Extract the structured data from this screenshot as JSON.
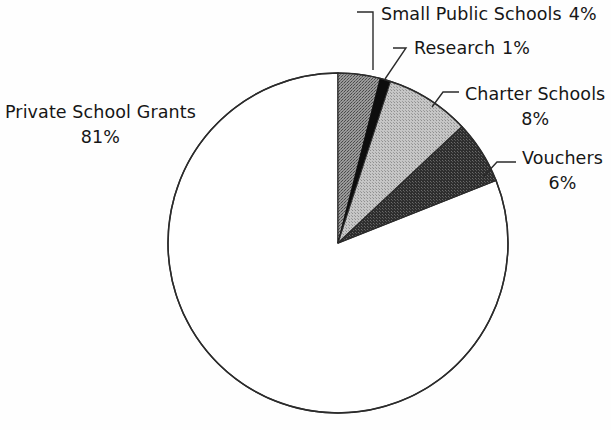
{
  "chart_data": {
    "type": "pie",
    "title": "",
    "subtitle": "",
    "xlabel": "",
    "ylabel": "",
    "legend_position": "callout-labels",
    "grid": false,
    "units": "percent",
    "start_angle_deg": 0,
    "direction": "clockwise",
    "categories": [
      "Small Public Schools",
      "Research",
      "Charter Schools",
      "Vouchers",
      "Private School Grants"
    ],
    "values": [
      4,
      1,
      8,
      6,
      81
    ],
    "slices": [
      {
        "label": "Small Public Schools",
        "value": 4,
        "value_text": "4%",
        "fill": "#8a8a8a",
        "start_deg": 0,
        "end_deg": 14.4,
        "label_layout": "inline"
      },
      {
        "label": "Research",
        "value": 1,
        "value_text": "1%",
        "fill": "#0d0d0d",
        "start_deg": 14.4,
        "end_deg": 18.0,
        "label_layout": "inline"
      },
      {
        "label": "Charter Schools",
        "value": 8,
        "value_text": "8%",
        "fill": "#b4b4b4",
        "start_deg": 18.0,
        "end_deg": 46.8,
        "label_layout": "stacked"
      },
      {
        "label": "Vouchers",
        "value": 6,
        "value_text": "6%",
        "fill": "#3d3d3d",
        "start_deg": 46.8,
        "end_deg": 68.4,
        "label_layout": "stacked"
      },
      {
        "label": "Private School Grants",
        "value": 81,
        "value_text": "81%",
        "fill": "#ffffff",
        "start_deg": 68.4,
        "end_deg": 360.0,
        "label_layout": "stacked"
      }
    ],
    "geometry": {
      "center_x": 338,
      "center_y": 243,
      "radius": 170,
      "outline_color": "#2b2b2b"
    }
  },
  "labels": {
    "small_public_schools": {
      "name": "Small Public Schools",
      "percent": "4%"
    },
    "research": {
      "name": "Research",
      "percent": "1%"
    },
    "charter_schools": {
      "name": "Charter Schools",
      "percent": "8%"
    },
    "vouchers": {
      "name": "Vouchers",
      "percent": "6%"
    },
    "private_school_grants": {
      "name": "Private School Grants",
      "percent": "81%"
    }
  }
}
